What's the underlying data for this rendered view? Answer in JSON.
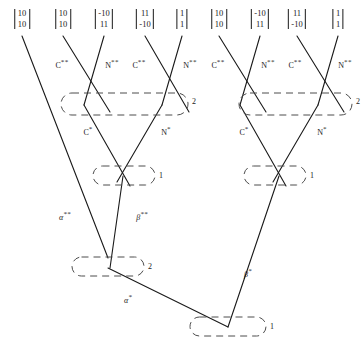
{
  "figure": {
    "type": "tree-diagram",
    "title": "",
    "background_color": "#ffffff",
    "line_color": "#1a1a1a",
    "dash_color": "#4d4d4d"
  },
  "matrices": [
    {
      "id": "m1",
      "top": "10",
      "bottom": "10",
      "x": 22,
      "y": 8
    },
    {
      "id": "m2",
      "top": "10",
      "bottom": "10",
      "x": 63,
      "y": 8
    },
    {
      "id": "m3",
      "top": "-10",
      "bottom": "11",
      "x": 104,
      "y": 8
    },
    {
      "id": "m4",
      "top": "11",
      "bottom": "-10",
      "x": 145,
      "y": 8
    },
    {
      "id": "m5",
      "top": "1",
      "bottom": "1",
      "x": 182,
      "y": 8
    },
    {
      "id": "m6",
      "top": "10",
      "bottom": "10",
      "x": 219,
      "y": 8
    },
    {
      "id": "m7",
      "top": "-10",
      "bottom": "11",
      "x": 260,
      "y": 8
    },
    {
      "id": "m8",
      "top": "11",
      "bottom": "-10",
      "x": 297,
      "y": 8
    },
    {
      "id": "m9",
      "top": "1",
      "bottom": "1",
      "x": 338,
      "y": 8
    }
  ],
  "edge_labels": [
    {
      "id": "c2a",
      "base": "C",
      "sup": "**",
      "x": 62,
      "y": 64
    },
    {
      "id": "n2a",
      "base": "N",
      "sup": "**",
      "x": 112,
      "y": 64
    },
    {
      "id": "c2b",
      "base": "C",
      "sup": "**",
      "x": 139,
      "y": 64
    },
    {
      "id": "n2b",
      "base": "N",
      "sup": "**",
      "x": 190,
      "y": 64
    },
    {
      "id": "c2c",
      "base": "C",
      "sup": "**",
      "x": 218,
      "y": 64
    },
    {
      "id": "n2c",
      "base": "N",
      "sup": "**",
      "x": 268,
      "y": 64
    },
    {
      "id": "c2d",
      "base": "C",
      "sup": "**",
      "x": 295,
      "y": 64
    },
    {
      "id": "n2d",
      "base": "N",
      "sup": "**",
      "x": 345,
      "y": 64
    },
    {
      "id": "c1a",
      "base": "C",
      "sup": "*",
      "x": 88,
      "y": 131
    },
    {
      "id": "n1a",
      "base": "N",
      "sup": "*",
      "x": 166,
      "y": 131
    },
    {
      "id": "c1b",
      "base": "C",
      "sup": "*",
      "x": 244,
      "y": 131
    },
    {
      "id": "n1b",
      "base": "N",
      "sup": "*",
      "x": 322,
      "y": 131
    },
    {
      "id": "alpha2",
      "base": "α",
      "sup": "**",
      "x": 65,
      "y": 216,
      "italic": true
    },
    {
      "id": "beta2",
      "base": "β",
      "sup": "**",
      "x": 142,
      "y": 216,
      "italic": true
    },
    {
      "id": "alpha1",
      "base": "α",
      "sup": "*",
      "x": 128,
      "y": 299,
      "italic": true
    },
    {
      "id": "beta1",
      "base": "β",
      "sup": "*",
      "x": 248,
      "y": 273,
      "italic": true
    }
  ],
  "capsules": [
    {
      "id": "cap-top-left",
      "x": 61,
      "y": 93,
      "w": 127,
      "h": 22,
      "label": "2",
      "label_x": 192,
      "label_y": 101
    },
    {
      "id": "cap-top-right",
      "x": 239,
      "y": 93,
      "w": 113,
      "h": 22,
      "label": "2",
      "label_x": 356,
      "label_y": 101
    },
    {
      "id": "cap-mid-left",
      "x": 93,
      "y": 166,
      "w": 62,
      "h": 19,
      "label": "1",
      "label_x": 159,
      "label_y": 175
    },
    {
      "id": "cap-mid-right",
      "x": 244,
      "y": 166,
      "w": 62,
      "h": 19,
      "label": "1",
      "label_x": 310,
      "label_y": 175
    },
    {
      "id": "cap-lower-left",
      "x": 72,
      "y": 257,
      "w": 72,
      "h": 19,
      "label": "2",
      "label_x": 148,
      "label_y": 266
    },
    {
      "id": "cap-bottom",
      "x": 190,
      "y": 317,
      "w": 76,
      "h": 19,
      "label": "1",
      "label_x": 270,
      "label_y": 326
    }
  ],
  "lines": [
    {
      "id": "long-left-alpha2",
      "x1": 22,
      "y1": 36,
      "x2": 108,
      "y2": 258
    },
    {
      "id": "v2a-left",
      "x1": 63,
      "y1": 36,
      "x2": 110,
      "y2": 112
    },
    {
      "id": "v2a-right",
      "x1": 104,
      "y1": 36,
      "x2": 84,
      "y2": 105
    },
    {
      "id": "v2b-left",
      "x1": 145,
      "y1": 36,
      "x2": 189,
      "y2": 112
    },
    {
      "id": "v2b-right",
      "x1": 182,
      "y1": 36,
      "x2": 162,
      "y2": 105
    },
    {
      "id": "v2c-left",
      "x1": 219,
      "y1": 36,
      "x2": 266,
      "y2": 112
    },
    {
      "id": "v2c-right",
      "x1": 260,
      "y1": 36,
      "x2": 240,
      "y2": 105
    },
    {
      "id": "v2d-left",
      "x1": 297,
      "y1": 36,
      "x2": 344,
      "y2": 112
    },
    {
      "id": "v2d-right",
      "x1": 338,
      "y1": 36,
      "x2": 318,
      "y2": 105
    },
    {
      "id": "c1-left-branch",
      "x1": 84,
      "y1": 105,
      "x2": 130,
      "y2": 186
    },
    {
      "id": "n1-left-branch",
      "x1": 162,
      "y1": 105,
      "x2": 117,
      "y2": 182
    },
    {
      "id": "c1-right-branch",
      "x1": 240,
      "y1": 105,
      "x2": 286,
      "y2": 186
    },
    {
      "id": "n1-right-branch",
      "x1": 318,
      "y1": 105,
      "x2": 273,
      "y2": 182
    },
    {
      "id": "beta2-down",
      "x1": 123,
      "y1": 176,
      "x2": 110,
      "y2": 268
    },
    {
      "id": "alpha1-long",
      "x1": 108,
      "y1": 268,
      "x2": 228,
      "y2": 327
    },
    {
      "id": "beta1-long",
      "x1": 279,
      "y1": 176,
      "x2": 228,
      "y2": 327
    }
  ]
}
